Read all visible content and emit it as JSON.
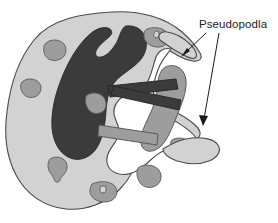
{
  "figure": {
    "background_color": "#ffffff"
  },
  "labels": [
    {
      "id": "pseudopodia",
      "text": "Pseudopodla",
      "x": 199,
      "y": 28
    }
  ],
  "leader_arrows": [
    {
      "id": "arrow-upper-pseudopod",
      "from_x": 205,
      "from_y": 34,
      "to_x": 182,
      "to_y": 56,
      "points_to": "upper-right-pseudopod"
    },
    {
      "id": "arrow-lower-pseudopod",
      "from_x": 218,
      "from_y": 34,
      "to_x": 203,
      "to_y": 125,
      "points_to": "lower-right-pseudopod"
    }
  ],
  "colors": {
    "cytoplasm": "#d2d2d2",
    "nucleus": "#3b3b3b",
    "granule": "#9d9d9d",
    "particle_dark": "#3b3b3b",
    "particle_grey": "#9d9d9d",
    "vacuole": "#ffffff",
    "outline": "#4a4a4a",
    "label_color": "#1a1a1a",
    "background": "#ffffff"
  },
  "structures": [
    {
      "id": "cell-body",
      "name": "cell-body",
      "color": "#d2d2d2"
    },
    {
      "id": "nucleus",
      "name": "lobed-nucleus",
      "color": "#3b3b3b"
    },
    {
      "id": "vacuole",
      "name": "phagocytic-vacuole",
      "color": "#ffffff"
    },
    {
      "id": "upper-right-pseudopod",
      "name": "upper-right-pseudopod",
      "color": "#d2d2d2"
    },
    {
      "id": "lower-right-pseudopod",
      "name": "lower-right-pseudopod",
      "color": "#d2d2d2"
    },
    {
      "id": "engulfed-blob",
      "name": "engulfed-particle-large",
      "color": "#9d9d9d"
    },
    {
      "id": "bacterium-upper",
      "name": "engulfed-rod-upper",
      "color": "#3b3b3b"
    },
    {
      "id": "bacterium-lower",
      "name": "engulfed-rod-lower",
      "color": "#3b3b3b"
    },
    {
      "id": "grey-rod",
      "name": "engulfed-rod-grey",
      "color": "#9d9d9d"
    }
  ],
  "granules": [
    {
      "id": "granule-1",
      "cx": 55,
      "cy": 50
    },
    {
      "id": "granule-2",
      "cx": 31,
      "cy": 88
    },
    {
      "id": "granule-3",
      "cx": 96,
      "cy": 103
    },
    {
      "id": "granule-4",
      "cx": 58,
      "cy": 168
    },
    {
      "id": "granule-5",
      "cx": 103,
      "cy": 192
    },
    {
      "id": "granule-6",
      "cx": 155,
      "cy": 36
    },
    {
      "id": "granule-7",
      "cx": 150,
      "cy": 176
    },
    {
      "id": "granule-8",
      "cx": 182,
      "cy": 147
    }
  ]
}
